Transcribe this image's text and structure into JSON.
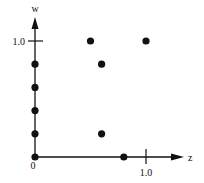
{
  "chart_data": {
    "type": "scatter",
    "title": "",
    "xlabel": "z",
    "ylabel": "w",
    "xlim": [
      0,
      1.2
    ],
    "ylim": [
      0,
      1.2
    ],
    "grid": false,
    "legend": null,
    "tick_labels": {
      "origin": "0",
      "x_tick": "1.0",
      "y_tick": "1.0"
    },
    "points": [
      {
        "z": 0.0,
        "w": 0.0
      },
      {
        "z": 0.0,
        "w": 0.2
      },
      {
        "z": 0.0,
        "w": 0.4
      },
      {
        "z": 0.0,
        "w": 0.6
      },
      {
        "z": 0.0,
        "w": 0.8
      },
      {
        "z": 0.5,
        "w": 1.0
      },
      {
        "z": 1.0,
        "w": 1.0
      },
      {
        "z": 0.6,
        "w": 0.8
      },
      {
        "z": 0.6,
        "w": 0.2
      },
      {
        "z": 0.8,
        "w": 0.0
      }
    ]
  },
  "colors": {
    "ink": "#111111",
    "background": "#ffffff"
  }
}
